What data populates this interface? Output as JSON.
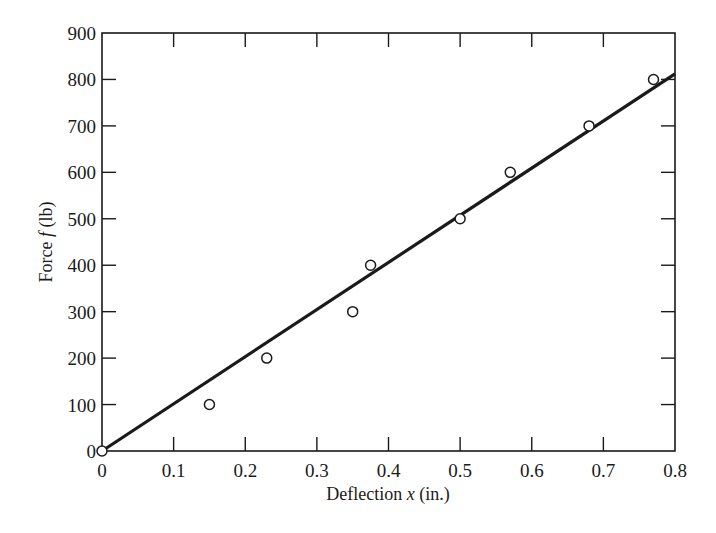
{
  "chart_data": {
    "type": "scatter",
    "title": "",
    "xlabel": "Deflection x (in.)",
    "xlabel_parts": {
      "pre": "Deflection ",
      "var": "x",
      "post": " (in.)"
    },
    "ylabel": "Force f (lb)",
    "ylabel_parts": {
      "pre": "Force ",
      "var": "f",
      "post": " (lb)"
    },
    "xlim": [
      0,
      0.8
    ],
    "ylim": [
      0,
      900
    ],
    "xticks": [
      0,
      0.1,
      0.2,
      0.3,
      0.4,
      0.5,
      0.6,
      0.7,
      0.8
    ],
    "xtick_labels": [
      "0",
      "0.1",
      "0.2",
      "0.3",
      "0.4",
      "0.5",
      "0.6",
      "0.7",
      "0.8"
    ],
    "yticks": [
      0,
      100,
      200,
      300,
      400,
      500,
      600,
      700,
      800,
      900
    ],
    "ytick_labels": [
      "0",
      "100",
      "200",
      "300",
      "400",
      "500",
      "600",
      "700",
      "800",
      "900"
    ],
    "grid": false,
    "legend": null,
    "series": [
      {
        "name": "Measured data",
        "kind": "scatter",
        "marker": "open-circle",
        "x": [
          0,
          0.15,
          0.23,
          0.35,
          0.375,
          0.5,
          0.57,
          0.68,
          0.77
        ],
        "y": [
          0,
          100,
          200,
          300,
          400,
          500,
          600,
          700,
          800
        ]
      },
      {
        "name": "Linear fit",
        "kind": "line",
        "x": [
          0,
          0.8
        ],
        "y": [
          0,
          812
        ]
      }
    ]
  },
  "colors": {
    "ink": "#1a1a1a",
    "background": "#ffffff"
  }
}
